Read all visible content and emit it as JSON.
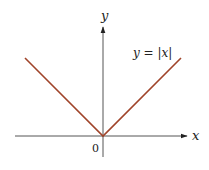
{
  "chart_data": {
    "type": "line",
    "title": "",
    "xlabel": "x",
    "ylabel": "y",
    "origin_label": "0",
    "annotation": "y = |x|",
    "function": "abs",
    "series": [
      {
        "name": "y = |x|",
        "x": [
          -1,
          0,
          1
        ],
        "y": [
          1,
          0,
          1
        ],
        "color": "#a0442a"
      }
    ],
    "xlim": [
      -1.1,
      1.1
    ],
    "ylim": [
      -0.2,
      1.35
    ],
    "grid": false,
    "axis_color": "#555555"
  }
}
